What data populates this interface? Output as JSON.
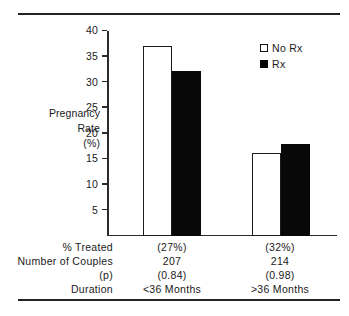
{
  "chart_data": {
    "type": "bar",
    "title": "",
    "xlabel": "",
    "ylabel": "Pregnancy Rate (%)",
    "ylim": [
      0,
      40
    ],
    "yticks": [
      5,
      10,
      15,
      20,
      25,
      30,
      35,
      40
    ],
    "ytick_labels": [
      "5",
      "10",
      "15",
      "20",
      "25",
      "30",
      "35",
      "40"
    ],
    "grid": false,
    "legend_position": "top-right",
    "categories": [
      "<36 Months",
      ">36 Months"
    ],
    "series": [
      {
        "name": "No Rx",
        "values": [
          37.0,
          16.2
        ],
        "fill": "#ffffff",
        "edge": "#1b1b1b"
      },
      {
        "name": "Rx",
        "values": [
          32.2,
          17.9
        ],
        "fill": "#080808",
        "edge": "#080808"
      }
    ],
    "annotations": {
      "percent_treated": [
        "(27%)",
        "(32%)"
      ],
      "number_of_couples": [
        "207",
        "214"
      ],
      "p_values": [
        "(0.84)",
        "(0.98)"
      ],
      "duration": [
        "<36 Months",
        ">36 Months"
      ]
    }
  },
  "axis": {
    "title_line1": "Pregnancy",
    "title_line2": "Rate",
    "title_line3": "(%)"
  },
  "legend": {
    "items": [
      {
        "label": "No  Rx",
        "style": "open"
      },
      {
        "label": "Rx",
        "style": "filled"
      }
    ]
  },
  "table": {
    "rows": [
      {
        "label": "%  Treated",
        "cells": [
          "(27%)",
          "(32%)"
        ]
      },
      {
        "label": "Number  of  Couples",
        "cells": [
          "207",
          "214"
        ]
      },
      {
        "label": "(p)",
        "cells": [
          "(0.84)",
          "(0.98)"
        ]
      },
      {
        "label": "Duration",
        "cells": [
          "<36  Months",
          ">36  Months"
        ]
      }
    ]
  }
}
